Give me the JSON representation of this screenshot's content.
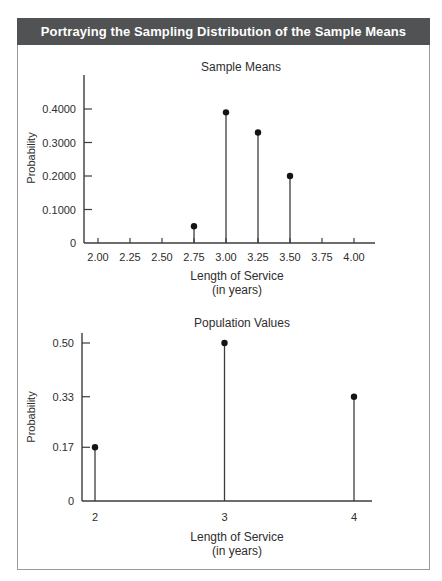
{
  "header": {
    "title": "Portraying the Sampling Distribution of the Sample Means"
  },
  "colors": {
    "header_bg": "#515254",
    "header_text": "#ffffff",
    "card_border": "#9a9a9a",
    "axis": "#3c3c3c",
    "dot": "#141414",
    "text": "#2e2e2e"
  },
  "chart_data": [
    {
      "id": "sample-means",
      "type": "stem",
      "title": "Sample Means",
      "xlabel": "Length of Service",
      "xlabel_sub": "(in years)",
      "ylabel": "Probability",
      "x_ticks": [
        {
          "value": 2.0,
          "label": "2.00"
        },
        {
          "value": 2.25,
          "label": "2.25"
        },
        {
          "value": 2.5,
          "label": "2.50"
        },
        {
          "value": 2.75,
          "label": "2.75"
        },
        {
          "value": 3.0,
          "label": "3.00"
        },
        {
          "value": 3.25,
          "label": "3.25"
        },
        {
          "value": 3.5,
          "label": "3.50"
        },
        {
          "value": 3.75,
          "label": "3.75"
        },
        {
          "value": 4.0,
          "label": "4.00"
        }
      ],
      "y_ticks": [
        {
          "value": 0,
          "label": "0"
        },
        {
          "value": 0.1,
          "label": "0.1000"
        },
        {
          "value": 0.2,
          "label": "0.2000"
        },
        {
          "value": 0.3,
          "label": "0.3000"
        },
        {
          "value": 0.4,
          "label": "0.4000"
        }
      ],
      "points": [
        {
          "x": 2.75,
          "probability": 0.05
        },
        {
          "x": 3.0,
          "probability": 0.39
        },
        {
          "x": 3.25,
          "probability": 0.33
        },
        {
          "x": 3.5,
          "probability": 0.2
        }
      ],
      "xlim": [
        2.0,
        4.0
      ],
      "ylim": [
        0,
        0.5
      ],
      "grid": false,
      "legend": false
    },
    {
      "id": "population-values",
      "type": "stem",
      "title": "Population Values",
      "xlabel": "Length of Service",
      "xlabel_sub": "(in years)",
      "ylabel": "Probability",
      "x_ticks": [
        {
          "value": 2,
          "label": "2"
        },
        {
          "value": 3,
          "label": "3"
        },
        {
          "value": 4,
          "label": "4"
        }
      ],
      "y_ticks": [
        {
          "value": 0,
          "label": "0"
        },
        {
          "value": 0.17,
          "label": "0.17"
        },
        {
          "value": 0.33,
          "label": "0.33"
        },
        {
          "value": 0.5,
          "label": "0.50"
        }
      ],
      "points": [
        {
          "x": 2,
          "probability": 0.17
        },
        {
          "x": 3,
          "probability": 0.5
        },
        {
          "x": 4,
          "probability": 0.33
        }
      ],
      "xlim": [
        2,
        4
      ],
      "ylim": [
        0,
        0.53
      ],
      "grid": false,
      "legend": false
    }
  ]
}
